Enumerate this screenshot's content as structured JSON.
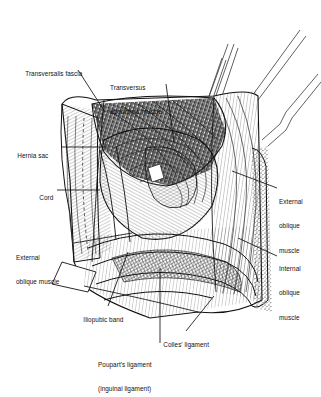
{
  "figure": {
    "kind": "surgical-anatomy-line-illustration",
    "background_color": "#ffffff",
    "ink_color": "#111111",
    "width": 321,
    "height": 370
  },
  "labels": [
    {
      "id": "transversalis-fascia",
      "text": "Transversalis fascia",
      "x": 18,
      "y": 62,
      "align": "left"
    },
    {
      "id": "transversus-abdominis-muscle",
      "line1": "Transversus",
      "line2": "abdominis muscle",
      "x": 110,
      "y": 68,
      "align": "left"
    },
    {
      "id": "hernia-sac",
      "text": "Hernia sac",
      "x": 10,
      "y": 144,
      "align": "left"
    },
    {
      "id": "cord",
      "text": "Cord",
      "x": 32,
      "y": 188,
      "align": "left"
    },
    {
      "id": "external-oblique-muscle-left",
      "line1": "External",
      "line2": "oblique muscle",
      "x": 16,
      "y": 238,
      "align": "left"
    },
    {
      "id": "external-oblique-muscle-right",
      "line1": "External",
      "line2": "oblique",
      "line3": "muscle",
      "x": 279,
      "y": 185,
      "align": "left"
    },
    {
      "id": "internal-oblique-muscle",
      "line1": "Internal",
      "line2": "oblique",
      "line3": "muscle",
      "x": 279,
      "y": 252,
      "align": "left"
    },
    {
      "id": "iliopubic-band",
      "text": "Iliopubic band",
      "x": 76,
      "y": 310,
      "align": "left"
    },
    {
      "id": "colles-ligament",
      "text": "Colles' ligament",
      "x": 156,
      "y": 335,
      "align": "left"
    },
    {
      "id": "pouparts-ligament",
      "line1": "Poupart's ligament",
      "line2": "(inguinal ligament)",
      "x": 98,
      "y": 347,
      "align": "left"
    }
  ],
  "leader_lines": [
    {
      "id": "leader-transversalis-fascia",
      "path": "M78 70 L105 112"
    },
    {
      "id": "leader-transversus-abdominis",
      "path": "M166 84 L174 142"
    },
    {
      "id": "leader-hernia-sac",
      "path": "M62 147 L108 147"
    },
    {
      "id": "leader-cord",
      "path": "M57 190 L100 190"
    },
    {
      "id": "leader-external-oblique-left",
      "path": "M74 243 L132 233"
    },
    {
      "id": "leader-external-oblique-right",
      "path": "M277 188 L232 171"
    },
    {
      "id": "leader-internal-oblique-right",
      "path": "M277 256 L238 238"
    },
    {
      "id": "leader-iliopubic-band",
      "path": "M108 306 L128 252"
    },
    {
      "id": "leader-colles-ligament",
      "path": "M186 331 L214 296"
    },
    {
      "id": "leader-pouparts-ligament",
      "path": "M160 343 L160 268"
    }
  ],
  "instruments": [
    {
      "id": "retractor-upper-left",
      "note": "slim double-shaft retractor entering from top"
    },
    {
      "id": "retractor-upper-right",
      "note": "angled retractor with notch"
    },
    {
      "id": "retractor-lower-right",
      "note": "second angled retractor with notch"
    }
  ],
  "regions": [
    {
      "id": "transversus-abdominis-fiber-mass",
      "texture": "dense cross-hatch"
    },
    {
      "id": "inguinal-canal-floor",
      "texture": "fine parallel line hatch"
    },
    {
      "id": "reflected-external-oblique-flap-left",
      "texture": "stroked flap with dashed fold"
    },
    {
      "id": "cut-edge-right",
      "texture": "stippled fat / cut margin"
    },
    {
      "id": "iliopubic-and-inguinal-bands",
      "texture": "curved fibrous banding"
    }
  ]
}
